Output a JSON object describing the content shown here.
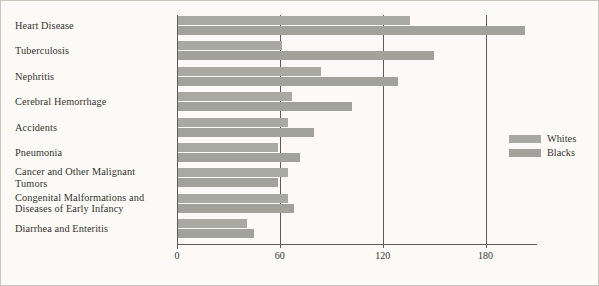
{
  "chart_data": {
    "type": "bar",
    "orientation": "horizontal",
    "title": "",
    "xlabel": "",
    "ylabel": "",
    "xlim": [
      0,
      210
    ],
    "xticks": [
      0,
      60,
      120,
      180
    ],
    "xtick_labels": [
      "0",
      "60",
      "120",
      "180"
    ],
    "grid": true,
    "grid_axis": "x",
    "legend_position": "right",
    "categories": [
      "Heart Disease",
      "Tuberculosis",
      "Nephritis",
      "Cerebral Hemorrhage",
      "Accidents",
      "Pneumonia",
      "Cancer and Other Malignant\nTumors",
      "Congenital Malformations and\nDiseases of Early Infancy",
      "Diarrhea and Enteritis"
    ],
    "series": [
      {
        "name": "Whites",
        "color": "#a9a9a4",
        "values": [
          136,
          61,
          84,
          67,
          65,
          59,
          65,
          65,
          41
        ]
      },
      {
        "name": "Blacks",
        "color": "#a2a29d",
        "values": [
          203,
          150,
          129,
          102,
          80,
          72,
          59,
          68,
          45
        ]
      }
    ]
  },
  "legend": {
    "entries": [
      {
        "label": "Whites",
        "color": "#a9a9a4"
      },
      {
        "label": "Blacks",
        "color": "#a2a29d"
      }
    ]
  }
}
